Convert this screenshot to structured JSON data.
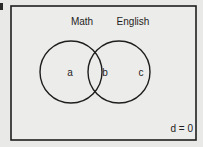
{
  "diagram": {
    "type": "venn",
    "sets": [
      {
        "name": "Math",
        "region_label": "a"
      },
      {
        "name": "English",
        "region_label": "c"
      }
    ],
    "intersection_label": "b",
    "outside_note": "d = 0",
    "colors": {
      "background": "#e9e9e7",
      "stroke": "#1e1e1e"
    }
  }
}
